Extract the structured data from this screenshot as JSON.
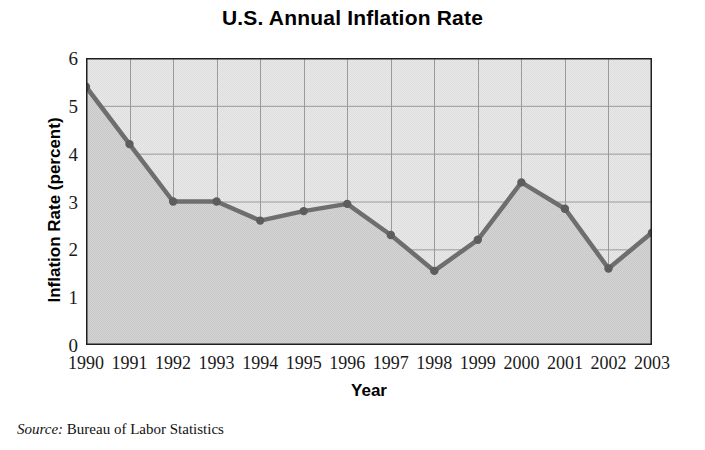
{
  "chart_data": {
    "type": "area",
    "title": "U.S. Annual Inflation Rate",
    "xlabel": "Year",
    "ylabel": "Inflation Rate (percent)",
    "categories": [
      "1990",
      "1991",
      "1992",
      "1993",
      "1994",
      "1995",
      "1996",
      "1997",
      "1998",
      "1999",
      "2000",
      "2001",
      "2002",
      "2003"
    ],
    "values": [
      5.4,
      4.2,
      3.0,
      3.0,
      2.6,
      2.8,
      2.95,
      2.3,
      1.55,
      2.2,
      3.4,
      2.85,
      1.6,
      2.35
    ],
    "series": [
      {
        "name": "U.S. Annual Inflation Rate",
        "values": [
          5.4,
          4.2,
          3.0,
          3.0,
          2.6,
          2.8,
          2.95,
          2.3,
          1.55,
          2.2,
          3.4,
          2.85,
          1.6,
          2.35
        ]
      }
    ],
    "ylim": [
      0,
      6
    ],
    "y_ticks": [
      "0",
      "1",
      "2",
      "3",
      "4",
      "5",
      "6"
    ],
    "x_ticks": [
      "1990",
      "1991",
      "1992",
      "1993",
      "1994",
      "1995",
      "1996",
      "1997",
      "1998",
      "1999",
      "2000",
      "2001",
      "2002",
      "2003"
    ],
    "grid": true,
    "legend": "none",
    "markers": true,
    "colors": {
      "line": "#6e6e6e",
      "marker": "#5d5d5d",
      "fill_below": "#cfcfcf",
      "plot_background": "#e6e6e6",
      "gridline": "#9a9a9a",
      "axis": "#1a1a1a",
      "text": "#000000"
    }
  },
  "source": {
    "label": "Source:",
    "value": "Bureau of Labor Statistics"
  }
}
